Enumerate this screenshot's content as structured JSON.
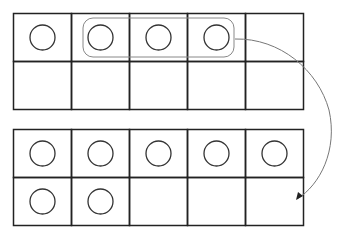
{
  "diagram": {
    "colors": {
      "grid": "#222222",
      "counter": "#333333",
      "group_outline": "#888888",
      "arrow": "#777777"
    },
    "top_frame": {
      "rows": 2,
      "cols": 5,
      "counters": [
        [
          0,
          0
        ],
        [
          0,
          1
        ],
        [
          0,
          2
        ],
        [
          0,
          3
        ]
      ],
      "grouped_counters": [
        [
          0,
          1
        ],
        [
          0,
          2
        ],
        [
          0,
          3
        ]
      ]
    },
    "bottom_frame": {
      "rows": 2,
      "cols": 5,
      "counters": [
        [
          0,
          0
        ],
        [
          0,
          1
        ],
        [
          0,
          2
        ],
        [
          0,
          3
        ],
        [
          0,
          4
        ],
        [
          1,
          0
        ],
        [
          1,
          1
        ]
      ]
    },
    "arrow": {
      "from": "top-frame-group",
      "to": "bottom-frame-cell-1-4"
    }
  }
}
